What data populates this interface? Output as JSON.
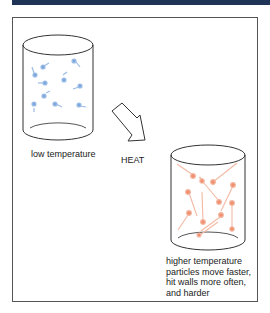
{
  "header": {
    "bar_color": "#1f3356"
  },
  "diagram": {
    "low": {
      "label": "low temperature",
      "particle_color": "#6f9fd8",
      "container": "cylinder"
    },
    "arrow": {
      "label": "HEAT",
      "icon": "hollow-arrow-icon"
    },
    "high": {
      "line1": "higher temperature",
      "line2": "particles move faster,",
      "line3": "hit walls more often,",
      "line4": "and harder",
      "particle_color": "#ee8a6a",
      "container": "cylinder"
    }
  }
}
